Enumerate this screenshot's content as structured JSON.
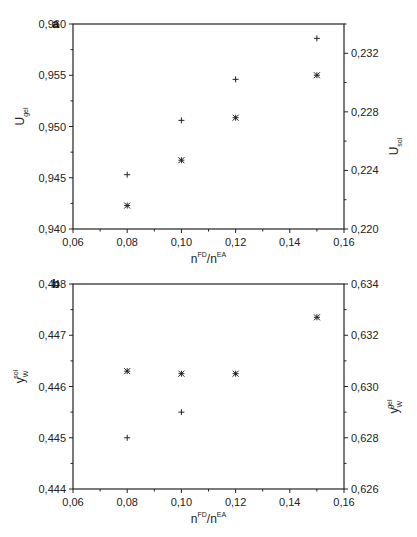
{
  "chart_data": [
    {
      "panel": "a",
      "type": "scatter",
      "title": "",
      "xlabel": "n^FD/n^EA",
      "ylabel_left": "U_gel",
      "ylabel_right": "U_sol",
      "xlim": [
        0.06,
        0.16
      ],
      "ylim_left": [
        0.94,
        0.96
      ],
      "ylim_right": [
        0.22,
        0.234
      ],
      "x_ticks": [
        "0,06",
        "0,08",
        "0,10",
        "0,12",
        "0,14",
        "0,16"
      ],
      "y_ticks_left": [
        "0,940",
        "0,945",
        "0,950",
        "0,955",
        "0,960"
      ],
      "y_ticks_right": [
        "0,220",
        "0,224",
        "0,228",
        "0,232"
      ],
      "grid": false,
      "series": [
        {
          "name": "U_gel",
          "marker": "+",
          "axis": "left",
          "x": [
            0.08,
            0.1,
            0.12,
            0.15
          ],
          "values": [
            0.9453,
            0.9506,
            0.9546,
            0.9586
          ]
        },
        {
          "name": "U_sol",
          "marker": "*",
          "axis": "right",
          "x": [
            0.08,
            0.1,
            0.12,
            0.15
          ],
          "values": [
            0.2216,
            0.2247,
            0.2276,
            0.2305
          ]
        }
      ]
    },
    {
      "panel": "b",
      "type": "scatter",
      "title": "",
      "xlabel": "n^FD/n^EA",
      "ylabel_left": "y_W^sol",
      "ylabel_right": "y_W^gel",
      "xlim": [
        0.06,
        0.16
      ],
      "ylim_left": [
        0.444,
        0.448
      ],
      "ylim_right": [
        0.626,
        0.634
      ],
      "x_ticks": [
        "0,06",
        "0,08",
        "0,10",
        "0,12",
        "0,14",
        "0,16"
      ],
      "y_ticks_left": [
        "0,444",
        "0,445",
        "0,446",
        "0,447",
        "0,448"
      ],
      "y_ticks_right": [
        "0,626",
        "0,628",
        "0,630",
        "0,632",
        "0,634"
      ],
      "grid": false,
      "series": [
        {
          "name": "y_W^sol",
          "marker": "+",
          "axis": "left",
          "x": [
            0.08,
            0.1
          ],
          "values": [
            0.445,
            0.4455
          ]
        },
        {
          "name": "y_W^gel",
          "marker": "*",
          "axis": "right",
          "x": [
            0.08,
            0.1,
            0.12,
            0.15
          ],
          "values": [
            0.6306,
            0.6305,
            0.6305,
            0.6327
          ]
        }
      ]
    }
  ],
  "panels": {
    "a": {
      "label": "a",
      "x_title_main": "n",
      "x_title_sup1": "FD",
      "x_title_mid": "/n",
      "x_title_sup2": "EA",
      "y_left_main": "U",
      "y_left_sub": "gel",
      "y_right_main": "U",
      "y_right_sub": "sol"
    },
    "b": {
      "label": "b",
      "x_title_main": "n",
      "x_title_sup1": "FD",
      "x_title_mid": "/n",
      "x_title_sup2": "EA",
      "y_left_main": "y",
      "y_left_sub": "W",
      "y_left_sup": "sol",
      "y_right_main": "y",
      "y_right_sub": "W",
      "y_right_sup": "gel"
    }
  }
}
